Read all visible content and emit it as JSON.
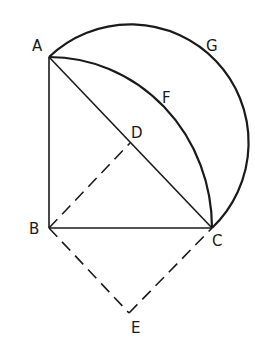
{
  "diagram": {
    "type": "geometry",
    "points": {
      "A": {
        "label": "A",
        "x": 49,
        "y": 57
      },
      "B": {
        "label": "B",
        "x": 49,
        "y": 228
      },
      "C": {
        "label": "C",
        "x": 212,
        "y": 228
      },
      "D": {
        "label": "D",
        "x": 130.5,
        "y": 142.5
      },
      "E": {
        "label": "E",
        "x": 129,
        "y": 313
      },
      "F": {
        "label": "F"
      },
      "G": {
        "label": "G"
      }
    },
    "solid_segments": [
      "AB",
      "BC",
      "AC"
    ],
    "dashed_segments": [
      "BD",
      "BE",
      "EC"
    ],
    "arcs": [
      {
        "name": "AFC",
        "center": "B",
        "style": "solid"
      },
      {
        "name": "AGC",
        "center": "D",
        "style": "solid",
        "kind": "semicircle"
      }
    ],
    "stroke_color": "#1a1a1a",
    "background": "#ffffff"
  }
}
